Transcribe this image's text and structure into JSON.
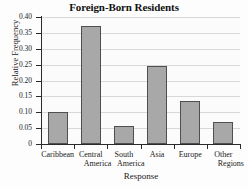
{
  "chart_data": {
    "type": "bar",
    "title": "Foreign-Born Residents",
    "xlabel": "Response",
    "ylabel": "Relative Frequency",
    "categories": [
      "Caribbean",
      "Central America",
      "South America",
      "Asia",
      "Europe",
      "Other Regions"
    ],
    "category_lines": [
      [
        "Caribbean",
        ""
      ],
      [
        "Central",
        "America"
      ],
      [
        "South",
        "America"
      ],
      [
        "Asia",
        ""
      ],
      [
        "Europe",
        ""
      ],
      [
        "Other",
        "Regions"
      ]
    ],
    "values": [
      0.1,
      0.372,
      0.058,
      0.247,
      0.135,
      0.07
    ],
    "ylim": [
      0,
      0.4
    ],
    "ytick_values": [
      0,
      0.05,
      0.1,
      0.15,
      0.2,
      0.25,
      0.3,
      0.35,
      0.4
    ],
    "ytick_labels": [
      "0",
      "0.05",
      "0.10",
      "0.15",
      "0.20",
      "0.25",
      "0.30",
      "0.35",
      "0.40"
    ],
    "grid": true,
    "legend": false,
    "bar_color": "#a8a8a8",
    "bar_border_color": "#4f4f4f",
    "grid_color": "#d8d8d8",
    "axis_color": "#2b2b2b",
    "plot_background": "#fbfbfb"
  }
}
